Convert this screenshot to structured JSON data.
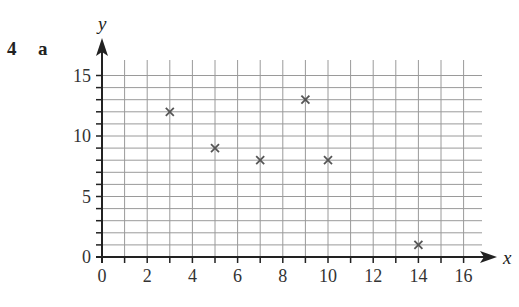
{
  "question": {
    "number": "4",
    "part": "a"
  },
  "chart_data": {
    "type": "scatter",
    "title": "",
    "xlabel": "x",
    "ylabel": "y",
    "xlim": [
      0,
      17
    ],
    "ylim": [
      0,
      16
    ],
    "x_ticks": [
      0,
      2,
      4,
      6,
      8,
      10,
      12,
      14,
      16
    ],
    "y_ticks": [
      0,
      5,
      10,
      15
    ],
    "grid": true,
    "grid_step": {
      "x": 1,
      "y": 1
    },
    "marker": "x",
    "points": [
      {
        "x": 3,
        "y": 12
      },
      {
        "x": 5,
        "y": 9
      },
      {
        "x": 7,
        "y": 8
      },
      {
        "x": 9,
        "y": 13
      },
      {
        "x": 10,
        "y": 8
      },
      {
        "x": 14,
        "y": 1
      }
    ]
  },
  "colors": {
    "axis": "#222222",
    "grid": "#9a9a9a",
    "marker": "#555555",
    "text": "#333333"
  }
}
